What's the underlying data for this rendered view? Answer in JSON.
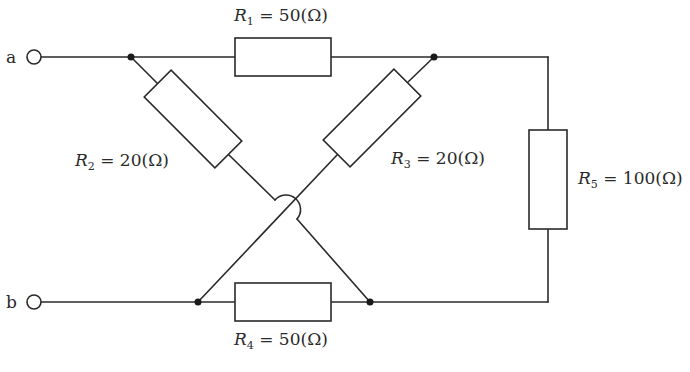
{
  "diagram": {
    "type": "resistor-circuit",
    "terminals": [
      {
        "id": "a",
        "label": "a"
      },
      {
        "id": "b",
        "label": "b"
      }
    ],
    "resistors": [
      {
        "id": "R1",
        "symbol": "R",
        "sub": "1",
        "value": " = 50(Ω)"
      },
      {
        "id": "R2",
        "symbol": "R",
        "sub": "2",
        "value": " = 20(Ω)"
      },
      {
        "id": "R3",
        "symbol": "R",
        "sub": "3",
        "value": " = 20(Ω)"
      },
      {
        "id": "R4",
        "symbol": "R",
        "sub": "4",
        "value": " = 50(Ω)"
      },
      {
        "id": "R5",
        "symbol": "R",
        "sub": "5",
        "value": " = 100(Ω)"
      }
    ]
  }
}
